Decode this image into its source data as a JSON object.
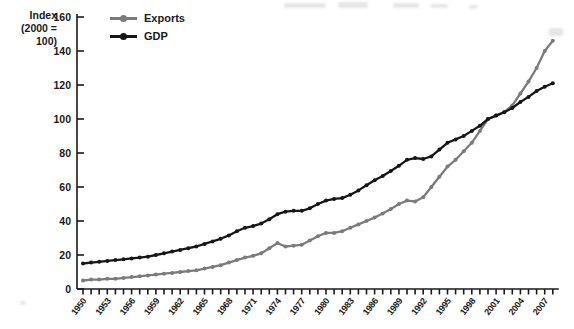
{
  "y_axis_title": {
    "line1": "Index",
    "line2": "(2000 = 100)"
  },
  "legend": {
    "exports_label": "Exports",
    "gdp_label": "GDP"
  },
  "colors": {
    "exports": "#7b7b7b",
    "gdp": "#161616",
    "axis": "#1a1a1a"
  },
  "chart_data": {
    "type": "line",
    "title": "",
    "xlabel": "",
    "ylabel": "Index (2000 = 100)",
    "ylim": [
      0,
      160
    ],
    "ytick_step": 20,
    "xtick_label_step": 3,
    "last_labeled_x": 2007,
    "grid": false,
    "legend_position": "top-left-inside",
    "x": [
      1950,
      1951,
      1952,
      1953,
      1954,
      1955,
      1956,
      1957,
      1958,
      1959,
      1960,
      1961,
      1962,
      1963,
      1964,
      1965,
      1966,
      1967,
      1968,
      1969,
      1970,
      1971,
      1972,
      1973,
      1974,
      1975,
      1976,
      1977,
      1978,
      1979,
      1980,
      1981,
      1982,
      1983,
      1984,
      1985,
      1986,
      1987,
      1988,
      1989,
      1990,
      1991,
      1992,
      1993,
      1994,
      1995,
      1996,
      1997,
      1998,
      1999,
      2000,
      2001,
      2002,
      2003,
      2004,
      2005,
      2006,
      2007,
      2008
    ],
    "series": [
      {
        "name": "Exports",
        "color_key": "exports",
        "values": [
          5,
          5.5,
          5.5,
          6,
          6,
          6.5,
          7,
          7.5,
          8,
          8.5,
          9,
          9.5,
          10,
          10.5,
          11,
          12,
          13,
          14,
          15.5,
          17,
          18.5,
          19.5,
          21,
          24,
          27,
          25,
          25.5,
          26,
          28.5,
          31,
          33,
          33,
          34,
          36,
          38,
          40,
          42,
          44.5,
          47,
          50,
          52,
          51.5,
          54,
          60,
          66,
          72,
          76,
          81,
          86,
          93,
          100,
          102,
          104,
          108,
          115,
          122,
          130,
          140,
          146
        ]
      },
      {
        "name": "GDP",
        "color_key": "gdp",
        "values": [
          15,
          15.5,
          16,
          16.5,
          17,
          17.5,
          18,
          18.5,
          19,
          20,
          21,
          22,
          23,
          24,
          25,
          26.5,
          28,
          29.5,
          31.5,
          34,
          36,
          37,
          38.5,
          41,
          44,
          45.5,
          46,
          46,
          47.5,
          50,
          52,
          53,
          53.5,
          55.5,
          58,
          61,
          64,
          66.5,
          69.5,
          72.5,
          76,
          77,
          76.5,
          78,
          82,
          86,
          88,
          90,
          93,
          96,
          100,
          102,
          104,
          106.5,
          110,
          113,
          116.5,
          119,
          121
        ]
      }
    ]
  }
}
